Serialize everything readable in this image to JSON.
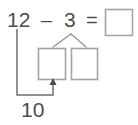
{
  "worksheet": {
    "type": "subtraction-number-bond",
    "equation": {
      "minuend": "12",
      "minus_sign": "–",
      "subtrahend": "3",
      "equals_sign": "=",
      "answer_value": ""
    },
    "number_bond": {
      "whole": "3",
      "left_part_value": "",
      "right_part_value": ""
    },
    "annotation": {
      "label": "10",
      "from": "12",
      "to": "left-part-box"
    },
    "colors": {
      "background": "#ffffff",
      "text": "#4d4d4d",
      "box_border": "#a0a0a0",
      "connector_line": "#8a8a8a",
      "arrow_line": "#6e6e6e"
    },
    "boxes": {
      "answer_box": {
        "x": 105,
        "y": 9,
        "w": 28,
        "h": 27
      },
      "left_part_box": {
        "x": 38,
        "y": 48,
        "w": 28,
        "h": 32
      },
      "right_part_box": {
        "x": 71,
        "y": 48,
        "w": 27,
        "h": 32
      }
    }
  }
}
